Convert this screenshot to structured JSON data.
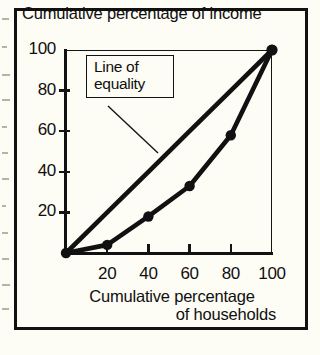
{
  "chart_data": {
    "type": "line",
    "title": "Cumulative percentage of income",
    "xlabel_line1": "Cumulative percentage",
    "xlabel_line2": "of households",
    "ylabel": "Cumulative percentage of income",
    "xlim": [
      0,
      100
    ],
    "ylim": [
      0,
      100
    ],
    "grid": false,
    "x_ticks": [
      20,
      40,
      60,
      80,
      100
    ],
    "y_ticks": [
      20,
      40,
      60,
      80,
      100
    ],
    "x": [
      0,
      20,
      40,
      60,
      80,
      100
    ],
    "series": [
      {
        "name": "Line of equality",
        "values": [
          0,
          20,
          40,
          60,
          80,
          100
        ],
        "markers": false
      },
      {
        "name": "Lorenz curve",
        "values": [
          0,
          4,
          18,
          33,
          58,
          100
        ],
        "markers": true
      }
    ],
    "annotations": [
      {
        "name": "line-of-equality-callout",
        "line1": "Line of",
        "line2": "equality",
        "points_to_series": "Line of equality"
      }
    ],
    "colors": {
      "ink": "#111111",
      "paper": "#fdfcf5"
    }
  }
}
